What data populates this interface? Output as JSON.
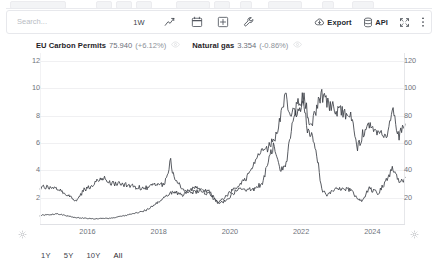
{
  "toolbar": {
    "search_placeholder": "Search...",
    "interval_label": "1W",
    "icons": [
      {
        "name": "line-chart-icon",
        "label": "Chart type"
      },
      {
        "name": "calendar-icon",
        "label": "Date range"
      },
      {
        "name": "add-indicator-icon",
        "label": "Add"
      },
      {
        "name": "wrench-icon",
        "label": "Tools"
      }
    ],
    "export_label": "Export",
    "api_label": "API",
    "fullscreen_label": "Fullscreen",
    "more_label": "More"
  },
  "legend": [
    {
      "name": "EU Carbon Permits",
      "value": "75.940",
      "change": "(+6.12%)",
      "axis": "right",
      "color": "#3b3f46"
    },
    {
      "name": "Natural gas",
      "value": "3.354",
      "change": "(-0.86%)",
      "axis": "left",
      "color": "#3b3f46"
    }
  ],
  "axes": {
    "left_ticks": [
      "12",
      "10",
      "8",
      "6",
      "4",
      "2"
    ],
    "right_ticks": [
      "120",
      "100",
      "80",
      "60",
      "40",
      "20"
    ],
    "x_ticks": [
      "2016",
      "2018",
      "2020",
      "2022",
      "2024"
    ]
  },
  "footer": {
    "ranges": [
      "1Y",
      "5Y",
      "10Y",
      "All"
    ],
    "active": "All"
  },
  "chart_data": {
    "type": "line",
    "title": "",
    "xlabel": "",
    "ylabel": "",
    "grid": true,
    "legend_position": "top-left",
    "x_ticks": [
      "2016",
      "2018",
      "2020",
      "2022",
      "2024"
    ],
    "xlim": [
      "2015-03",
      "2025-06"
    ],
    "left_axis": {
      "label": "Natural gas (USD/MMBtu)",
      "ylim": [
        0,
        12.6
      ],
      "ticks": [
        2,
        4,
        6,
        8,
        10,
        12
      ]
    },
    "right_axis": {
      "label": "EU Carbon Permits (EUR/t)",
      "ylim": [
        0,
        126
      ],
      "ticks": [
        20,
        40,
        60,
        80,
        100,
        120
      ]
    },
    "series": [
      {
        "name": "Natural gas",
        "axis": "left",
        "color": "#3b3f46",
        "last_value": 3.354,
        "last_change_pct": -0.86,
        "x": [
          "2015-03",
          "2015-06",
          "2015-09",
          "2015-12",
          "2016-03",
          "2016-06",
          "2016-09",
          "2016-12",
          "2017-03",
          "2017-06",
          "2017-09",
          "2017-12",
          "2018-03",
          "2018-06",
          "2018-09",
          "2018-11",
          "2018-12",
          "2019-03",
          "2019-06",
          "2019-09",
          "2019-12",
          "2020-03",
          "2020-06",
          "2020-09",
          "2020-12",
          "2021-03",
          "2021-06",
          "2021-09",
          "2021-10",
          "2021-12",
          "2022-02",
          "2022-04",
          "2022-06",
          "2022-08",
          "2022-09",
          "2022-11",
          "2022-12",
          "2023-02",
          "2023-04",
          "2023-06",
          "2023-09",
          "2023-12",
          "2024-03",
          "2024-06",
          "2024-09",
          "2024-12",
          "2025-02",
          "2025-04",
          "2025-06"
        ],
        "values": [
          2.75,
          2.8,
          2.65,
          2.2,
          1.75,
          2.6,
          2.95,
          3.5,
          3.05,
          3.0,
          2.95,
          2.75,
          2.7,
          2.95,
          3.0,
          4.7,
          3.6,
          2.7,
          2.35,
          2.55,
          2.25,
          1.65,
          1.75,
          2.55,
          2.6,
          2.55,
          3.1,
          5.45,
          5.8,
          3.85,
          4.6,
          7.25,
          8.5,
          9.2,
          6.9,
          6.3,
          5.6,
          2.45,
          2.2,
          2.55,
          2.7,
          2.5,
          1.7,
          2.65,
          2.3,
          3.4,
          4.2,
          3.3,
          3.354
        ]
      },
      {
        "name": "EU Carbon Permits",
        "axis": "right",
        "color": "#3b3f46",
        "last_value": 75.94,
        "last_change_pct": 6.12,
        "x": [
          "2015-03",
          "2015-09",
          "2016-03",
          "2016-09",
          "2017-03",
          "2017-09",
          "2018-03",
          "2018-06",
          "2018-09",
          "2018-12",
          "2019-03",
          "2019-07",
          "2019-12",
          "2020-03",
          "2020-06",
          "2020-09",
          "2020-12",
          "2021-02",
          "2021-05",
          "2021-08",
          "2021-11",
          "2021-12",
          "2022-02",
          "2022-03",
          "2022-05",
          "2022-08",
          "2022-10",
          "2022-12",
          "2023-02",
          "2023-04",
          "2023-06",
          "2023-09",
          "2023-12",
          "2024-02",
          "2024-04",
          "2024-06",
          "2024-09",
          "2024-12",
          "2025-02",
          "2025-04",
          "2025-06"
        ],
        "values": [
          7.0,
          8.2,
          5.5,
          4.5,
          5.0,
          7.5,
          11.0,
          15.5,
          20.5,
          24.5,
          22.0,
          27.5,
          24.5,
          16.0,
          22.0,
          27.5,
          32.5,
          39.0,
          52.0,
          57.0,
          67.0,
          80.0,
          96.0,
          78.0,
          84.0,
          96.0,
          72.0,
          84.0,
          96.0,
          88.0,
          86.0,
          82.0,
          78.0,
          56.0,
          68.0,
          72.0,
          65.0,
          68.0,
          82.0,
          64.0,
          75.94
        ]
      }
    ]
  }
}
